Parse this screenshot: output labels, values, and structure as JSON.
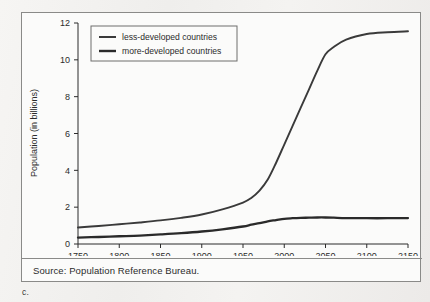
{
  "figure": {
    "caption_label": "c.",
    "source_text": "Source: Population Reference Bureau."
  },
  "chart_data": {
    "type": "line",
    "title": "",
    "subtitle": "",
    "xlabel": "",
    "ylabel": "Population (in billions)",
    "xlim": [
      1750,
      2150
    ],
    "ylim": [
      0,
      12
    ],
    "xticks": [
      1750,
      1800,
      1850,
      1900,
      1950,
      2000,
      2050,
      2100,
      2150
    ],
    "yticks": [
      0,
      2,
      4,
      6,
      8,
      10,
      12
    ],
    "xtick_labels": [
      "1750",
      "1800",
      "1850",
      "1900",
      "1950",
      "2000",
      "2050",
      "2100",
      "2150"
    ],
    "ytick_labels": [
      "0",
      "2",
      "4",
      "6",
      "8",
      "10",
      "12"
    ],
    "grid": false,
    "legend_position": "upper-left-inside",
    "line_color": "#3a3a3a",
    "x": [
      1750,
      1775,
      1800,
      1825,
      1850,
      1875,
      1900,
      1925,
      1950,
      1960,
      1970,
      1980,
      1990,
      2000,
      2010,
      2020,
      2030,
      2040,
      2050,
      2060,
      2075,
      2100,
      2125,
      2150
    ],
    "series": [
      {
        "name": "less-developed countries",
        "values": [
          0.9,
          0.98,
          1.07,
          1.17,
          1.28,
          1.42,
          1.6,
          1.88,
          2.25,
          2.5,
          2.9,
          3.5,
          4.4,
          5.4,
          6.4,
          7.4,
          8.4,
          9.4,
          10.3,
          10.7,
          11.1,
          11.4,
          11.5,
          11.55
        ]
      },
      {
        "name": "more-developed countries",
        "values": [
          0.35,
          0.38,
          0.42,
          0.46,
          0.52,
          0.59,
          0.68,
          0.8,
          0.95,
          1.05,
          1.13,
          1.23,
          1.3,
          1.37,
          1.4,
          1.42,
          1.43,
          1.44,
          1.44,
          1.43,
          1.41,
          1.4,
          1.4,
          1.41
        ]
      }
    ]
  },
  "legend": {
    "entries": [
      {
        "label": "less-developed countries",
        "color": "#3a3a3a"
      },
      {
        "label": "more-developed countries",
        "color": "#2a2a2a"
      }
    ]
  }
}
